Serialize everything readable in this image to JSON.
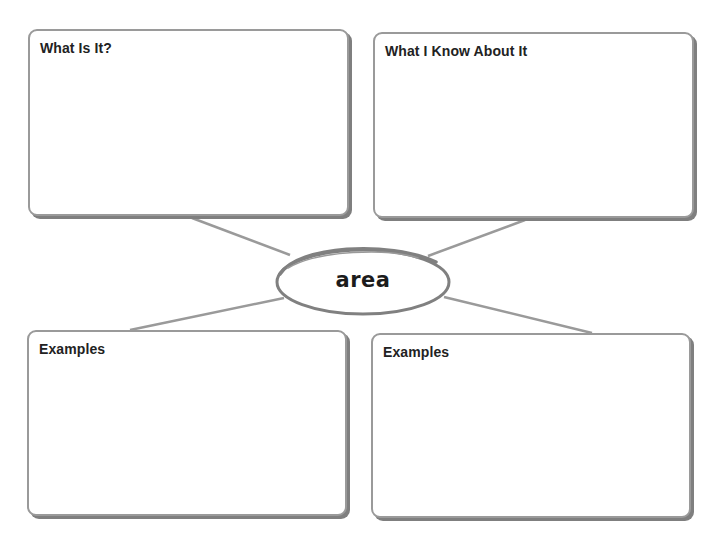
{
  "organizer": {
    "center_term": "area",
    "boxes": [
      {
        "position": "top-left",
        "title": "What Is It?",
        "content": ""
      },
      {
        "position": "top-right",
        "title": "What I Know About It",
        "content": ""
      },
      {
        "position": "bottom-left",
        "title": "Examples",
        "content": ""
      },
      {
        "position": "bottom-right",
        "title": "Examples",
        "content": ""
      }
    ]
  },
  "colors": {
    "box_border": "#9a9a9a",
    "box_shadow": "#7f7f7f",
    "connector": "#9a9a9a",
    "oval_stroke": "#808080",
    "text": "#222222",
    "background": "#ffffff"
  }
}
